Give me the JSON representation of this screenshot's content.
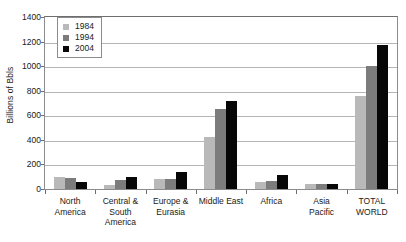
{
  "chart_data": {
    "type": "bar",
    "title": "",
    "xlabel": "",
    "ylabel": "Billions of Bbls",
    "ylim": [
      0,
      1400
    ],
    "ytick_step": 200,
    "grid": true,
    "legend_position": "top-left-inside",
    "categories": [
      "North America",
      "Central & South America",
      "Europe & Eurasia",
      "Middle East",
      "Africa",
      "Asia Pacific",
      "TOTAL WORLD"
    ],
    "category_lines": [
      [
        "North",
        "America"
      ],
      [
        "Central &",
        "South",
        "America"
      ],
      [
        "Europe &",
        "Eurasia"
      ],
      [
        "Middle East"
      ],
      [
        "Africa"
      ],
      [
        "Asia",
        "Pacific"
      ],
      [
        "TOTAL",
        "WORLD"
      ]
    ],
    "yticks": [
      "0",
      "200",
      "400",
      "600",
      "800",
      "1000",
      "1200",
      "1400"
    ],
    "series": [
      {
        "name": "1984",
        "color": "#b9b9b9",
        "values": [
          101,
          36,
          80,
          420,
          58,
          38,
          760
        ]
      },
      {
        "name": "1994",
        "color": "#7c7c7c",
        "values": [
          89,
          75,
          80,
          650,
          65,
          44,
          1000
        ]
      },
      {
        "name": "2004",
        "color": "#070707",
        "values": [
          61,
          101,
          140,
          720,
          112,
          41,
          1170
        ]
      }
    ]
  },
  "legend": {
    "entries": [
      {
        "label": "1984"
      },
      {
        "label": "1994"
      },
      {
        "label": "2004"
      }
    ]
  }
}
